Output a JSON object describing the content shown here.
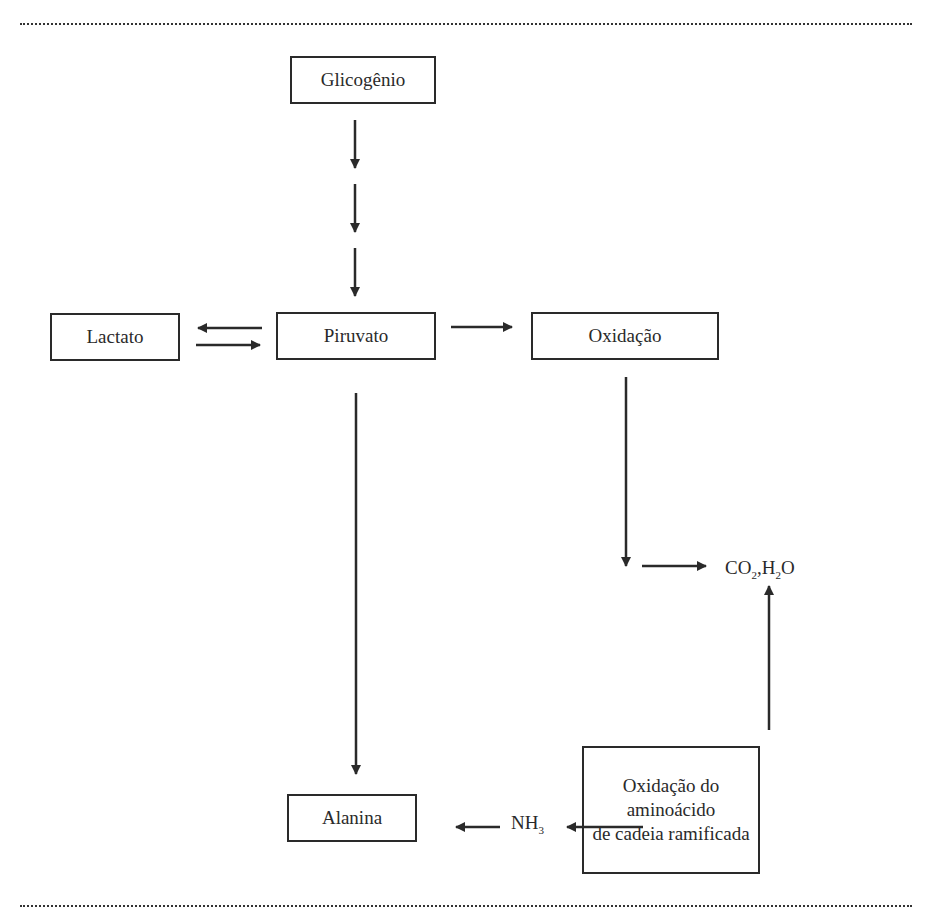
{
  "diagram": {
    "nodes": {
      "glicogenio": "Glicogênio",
      "lactato": "Lactato",
      "piruvato": "Piruvato",
      "oxidacao": "Oxidação",
      "alanina": "Alanina",
      "oxidacao_aminoacido_line1": "Oxidação do aminoácido",
      "oxidacao_aminoacido_line2": "de cadeia ramificada"
    },
    "products": {
      "co2": "CO",
      "co2_sub": "2",
      "sep": ",",
      "h2o_h": "H",
      "h2o_sub": "2",
      "h2o_o": "O",
      "nh3": "NH",
      "nh3_sub": "3"
    },
    "edges": [
      {
        "from": "Glicogênio",
        "to": "Piruvato",
        "style": "three-step arrows"
      },
      {
        "from": "Piruvato",
        "to": "Lactato"
      },
      {
        "from": "Lactato",
        "to": "Piruvato"
      },
      {
        "from": "Piruvato",
        "to": "Oxidação"
      },
      {
        "from": "Oxidação",
        "to": "CO2,H2O"
      },
      {
        "from": "Piruvato",
        "to": "Alanina"
      },
      {
        "from": "Oxidação do aminoácido de cadeia ramificada",
        "to": "CO2,H2O"
      },
      {
        "from": "Oxidação do aminoácido de cadeia ramificada",
        "to": "NH3"
      },
      {
        "from": "NH3",
        "to": "Alanina"
      }
    ]
  }
}
